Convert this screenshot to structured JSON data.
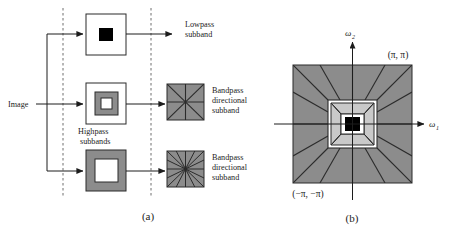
{
  "figure": {
    "panel_a": {
      "caption": "(a)",
      "input_label": "Image",
      "outputs": [
        {
          "line1": "Lowpass",
          "line2": "subband"
        },
        {
          "line1": "Bandpass",
          "line2": "directional",
          "line3": "subband"
        },
        {
          "line1": "Bandpass",
          "line2": "directional",
          "line3": "subband"
        }
      ],
      "middle_label": {
        "line1": "Highpass",
        "line2": "subbands"
      },
      "stage_boxes": [
        {
          "name": "lowpass-subband-box",
          "kind": "center-black-square"
        },
        {
          "name": "highpass-subband-box-level1",
          "kind": "gray-ring-white-center"
        },
        {
          "name": "highpass-subband-box-level2",
          "kind": "gray-outer-white-center"
        }
      ],
      "directional_boxes": [
        {
          "name": "directional-box-8",
          "wedges": 8
        },
        {
          "name": "directional-box-16",
          "wedges": 16
        }
      ]
    },
    "panel_b": {
      "caption": "(b)",
      "axis_x_label": "ω",
      "axis_x_sub": "1",
      "axis_y_label": "ω",
      "axis_y_sub": "2",
      "corner_top_right": "(π, π)",
      "corner_bottom_left": "(−π, −π)",
      "wedges_outer": 16,
      "wedges_inner": 8
    },
    "colors": {
      "gray_fill": "#8c8c8c",
      "light_gray_fill": "#c9c9c9",
      "white_fill": "#ffffff",
      "black_fill": "#000000",
      "stroke": "#2b2b2b",
      "dashed_guide": "#6e6e6e"
    }
  }
}
